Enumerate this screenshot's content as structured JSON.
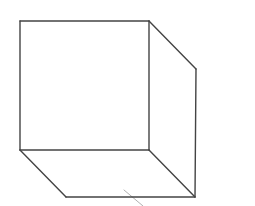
{
  "diagram": {
    "type": "wireframe-cube",
    "stroke_color": "#444444",
    "stroke_width": 1.4,
    "accent_stroke_color": "#b0b0b0",
    "vertices": {
      "front_top_left": [
        20,
        21
      ],
      "front_top_right": [
        149,
        21
      ],
      "front_bottom_left": [
        20,
        150
      ],
      "front_bottom_right": [
        149,
        150
      ],
      "back_top_right": [
        196,
        69
      ],
      "back_bottom_left": [
        66,
        197
      ],
      "back_bottom_right": [
        195,
        197
      ]
    },
    "edges": [
      {
        "name": "front-top-edge",
        "from": [
          20,
          21
        ],
        "to": [
          149,
          21
        ]
      },
      {
        "name": "front-left-edge",
        "from": [
          20,
          21
        ],
        "to": [
          20,
          150
        ]
      },
      {
        "name": "front-right-edge",
        "from": [
          149,
          21
        ],
        "to": [
          149,
          150
        ]
      },
      {
        "name": "front-bottom-edge",
        "from": [
          20,
          150
        ],
        "to": [
          149,
          150
        ]
      },
      {
        "name": "top-right-depth-edge",
        "from": [
          149,
          21
        ],
        "to": [
          196,
          69
        ]
      },
      {
        "name": "back-right-edge",
        "from": [
          196,
          69
        ],
        "to": [
          195,
          197
        ]
      },
      {
        "name": "bottom-left-depth-edge",
        "from": [
          20,
          150
        ],
        "to": [
          66,
          197
        ]
      },
      {
        "name": "bottom-right-depth-edge",
        "from": [
          149,
          150
        ],
        "to": [
          195,
          197
        ]
      },
      {
        "name": "back-bottom-edge",
        "from": [
          66,
          197
        ],
        "to": [
          195,
          197
        ]
      }
    ],
    "accent_marks": [
      {
        "name": "tick-mark",
        "from": [
          124,
          190
        ],
        "to": [
          143,
          206
        ]
      }
    ]
  }
}
